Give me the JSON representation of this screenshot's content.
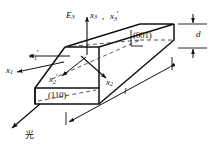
{
  "figure": {
    "background_color": "#ffffff",
    "line_color": "#111111",
    "dashed_color": "#555555"
  },
  "labels": {
    "field": {
      "base": "E",
      "sub": "3",
      "name": "applied-electric-field"
    },
    "axis_x3": {
      "base": "x",
      "sub": "3",
      "prime": ""
    },
    "axis_x3_prime": {
      "base": "x",
      "sub": "3",
      "prime": "′"
    },
    "axis_x1": {
      "base": "x",
      "sub": "1",
      "prime": ""
    },
    "axis_x1_prime": {
      "base": "x",
      "sub": "1",
      "prime": "′"
    },
    "axis_x2": {
      "base": "x",
      "sub": "2",
      "prime": ""
    },
    "axis_x2_prime": {
      "base": "x",
      "sub": "2",
      "prime": "′"
    },
    "comma": ",",
    "face_top": "(001)",
    "face_front": "(110)",
    "dim_thickness": "d",
    "dim_length": "l",
    "light": "光"
  },
  "geometry": {
    "note": "isometric rectangular bar, long axis to lower-left",
    "top_face": "parallelogram",
    "thickness_dimension": "d",
    "length_dimension": "l"
  }
}
